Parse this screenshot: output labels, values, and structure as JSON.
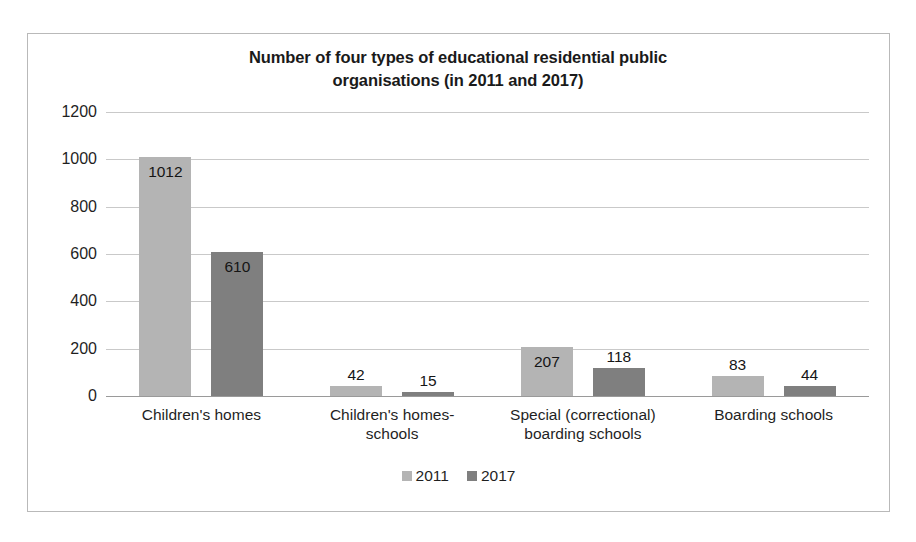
{
  "chart_data": {
    "type": "bar",
    "title": "Number of four types of educational residential public organisations (in 2011 and 2017)",
    "title_line1": "Number of four types of educational residential public",
    "title_line2": "organisations (in 2011 and 2017)",
    "xlabel": "",
    "ylabel": "",
    "ylim": [
      0,
      1200
    ],
    "ytick_values": [
      1200,
      1000,
      800,
      600,
      400,
      200,
      0
    ],
    "ytick_labels": [
      "1200",
      "1000",
      "800",
      "600",
      "400",
      "200",
      "0"
    ],
    "grid": true,
    "legend_position": "bottom",
    "categories": [
      "Children's homes",
      "Children's homes-schools",
      "Special (correctional) boarding schools",
      "Boarding schools"
    ],
    "category_lines": [
      [
        "Children's homes"
      ],
      [
        "Children's homes-",
        "schools"
      ],
      [
        "Special (correctional)",
        "boarding schools"
      ],
      [
        "Boarding schools"
      ]
    ],
    "series": [
      {
        "name": "2011",
        "color": "#b4b4b4",
        "values": [
          1012,
          42,
          207,
          83
        ]
      },
      {
        "name": "2017",
        "color": "#7f7f7f",
        "values": [
          610,
          15,
          118,
          44
        ]
      }
    ],
    "data_labels": [
      [
        "1012",
        "610"
      ],
      [
        "42",
        "15"
      ],
      [
        "207",
        "118"
      ],
      [
        "83",
        "44"
      ]
    ]
  },
  "legend": {
    "items": [
      {
        "label": "2011",
        "color": "#b4b4b4"
      },
      {
        "label": "2017",
        "color": "#7f7f7f"
      }
    ]
  },
  "colors": {
    "series_2011": "#b4b4b4",
    "series_2017": "#7f7f7f",
    "gridline": "#c9c9c9",
    "axis": "#9a9a9a",
    "border": "#b9b9b9",
    "text": "#1f1f1f",
    "background": "#ffffff"
  }
}
